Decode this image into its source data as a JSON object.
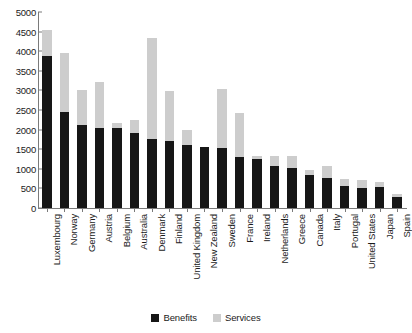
{
  "chart_data": {
    "type": "bar",
    "stacked": true,
    "title": "",
    "subtitle": "",
    "xlabel": "",
    "ylabel": "",
    "ylim": [
      0,
      5000
    ],
    "ytick_step": 500,
    "ytick_labels": [
      "5000",
      "4500",
      "4000",
      "3500",
      "3000",
      "2500",
      "2000",
      "1500",
      "1000",
      "500",
      "0"
    ],
    "ytick_values": [
      5000,
      4500,
      4000,
      3500,
      3000,
      2500,
      2000,
      1500,
      1000,
      500,
      0
    ],
    "grid": false,
    "legend_position": "bottom",
    "categories": [
      "Luxembourg",
      "Norway",
      "Germany",
      "Austria",
      "Belgium",
      "Australia",
      "Denmark",
      "Finland",
      "United Kingdom",
      "New Zealand",
      "Sweden",
      "France",
      "Ireland",
      "Netherlands",
      "Greece",
      "Canada",
      "Italy",
      "Portugal",
      "United States",
      "Japan",
      "Spain"
    ],
    "series": [
      {
        "name": "Benefits",
        "color": "#161616",
        "values": [
          3870,
          2460,
          2130,
          2050,
          2030,
          1920,
          1770,
          1710,
          1610,
          1550,
          1530,
          1300,
          1250,
          1080,
          1010,
          830,
          760,
          560,
          520,
          530,
          290
        ]
      },
      {
        "name": "Services",
        "color": "#cdcdcd",
        "values": [
          680,
          1500,
          880,
          1170,
          150,
          330,
          2560,
          1280,
          390,
          0,
          1510,
          1120,
          80,
          250,
          330,
          130,
          310,
          170,
          190,
          130,
          70
        ]
      }
    ],
    "totals": [
      4550,
      3960,
      3010,
      3220,
      2180,
      2250,
      4330,
      2990,
      2000,
      1550,
      3040,
      2420,
      1330,
      1330,
      1340,
      960,
      1070,
      730,
      710,
      660,
      360
    ]
  },
  "legend": {
    "items": [
      {
        "label": "Benefits",
        "swatch": "#161616",
        "icon": "square-swatch-icon"
      },
      {
        "label": "Services",
        "swatch": "#cdcdcd",
        "icon": "square-swatch-icon"
      }
    ]
  }
}
